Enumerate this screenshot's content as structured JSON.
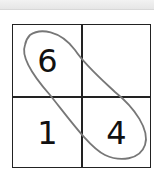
{
  "grid": {
    "rows": 2,
    "cols": 2,
    "cells": [
      {
        "row": 0,
        "col": 0,
        "value": "6"
      },
      {
        "row": 0,
        "col": 1,
        "value": ""
      },
      {
        "row": 1,
        "col": 0,
        "value": "1"
      },
      {
        "row": 1,
        "col": 1,
        "value": "4"
      }
    ]
  },
  "annotation": {
    "type": "loop",
    "encircles": [
      "6",
      "4"
    ],
    "color": "#777777"
  }
}
